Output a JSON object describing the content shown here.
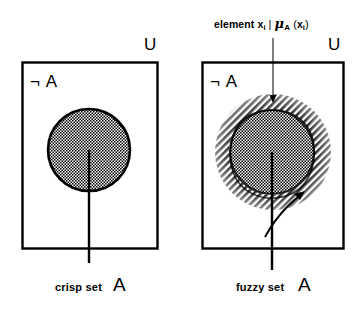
{
  "figure": {
    "background_color": "#ffffff",
    "ink_color": "#000000"
  },
  "panels": [
    {
      "id": "crisp",
      "universe_label": "U",
      "complement_label": "¬ A",
      "caption_text": "crisp set",
      "caption_symbol": "A",
      "set_fill_pattern": "checkered-dot",
      "boundary": "sharp"
    },
    {
      "id": "fuzzy",
      "universe_label": "U",
      "complement_label": "¬ A",
      "caption_text": "fuzzy set",
      "caption_symbol": "A",
      "set_fill_pattern": "checkered-dot",
      "boundary_fill_pattern": "diagonal-hatch",
      "boundary": "graded"
    }
  ],
  "annotation": {
    "element_word": "element",
    "variable": "x",
    "variable_subscript": "i",
    "separator": "|",
    "membership_symbol": "μ",
    "membership_subscript": "A",
    "open_paren": "(",
    "close_paren": ")"
  }
}
